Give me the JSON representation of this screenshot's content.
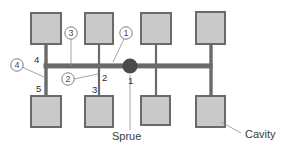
{
  "diagram": {
    "colors": {
      "cavity_fill": "#c9c9c9",
      "cavity_stroke": "#6a6a6a",
      "runner": "#6a6a6a",
      "sprue": "#4a4a4a",
      "leader": "#8d8d8d",
      "background": "#ffffff"
    },
    "callouts": [
      {
        "id": "callout-1",
        "label": "1"
      },
      {
        "id": "callout-2",
        "label": "2"
      },
      {
        "id": "callout-3",
        "label": "3"
      },
      {
        "id": "callout-4",
        "label": "4"
      }
    ],
    "segment_numbers": [
      {
        "id": "segment-1",
        "label": "1"
      },
      {
        "id": "segment-2",
        "label": "2"
      },
      {
        "id": "segment-3",
        "label": "3"
      },
      {
        "id": "segment-4",
        "label": "4"
      },
      {
        "id": "segment-5",
        "label": "5"
      }
    ],
    "text_labels": [
      {
        "id": "sprue-label",
        "label": "Sprue"
      },
      {
        "id": "cavity-label",
        "label": "Cavity"
      }
    ],
    "cavities": [
      {
        "id": "cavity-top-1",
        "row": "top",
        "index": 1
      },
      {
        "id": "cavity-top-2",
        "row": "top",
        "index": 2
      },
      {
        "id": "cavity-top-3",
        "row": "top",
        "index": 3
      },
      {
        "id": "cavity-top-4",
        "row": "top",
        "index": 4
      },
      {
        "id": "cavity-bottom-1",
        "row": "bottom",
        "index": 1
      },
      {
        "id": "cavity-bottom-2",
        "row": "bottom",
        "index": 2
      },
      {
        "id": "cavity-bottom-3",
        "row": "bottom",
        "index": 3
      },
      {
        "id": "cavity-bottom-4",
        "row": "bottom",
        "index": 4
      }
    ]
  }
}
